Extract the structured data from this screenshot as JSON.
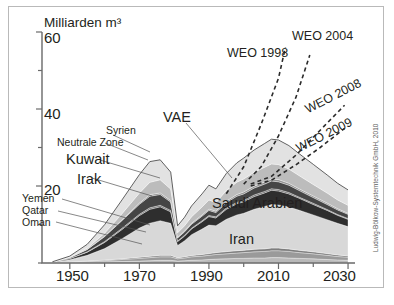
{
  "figure": {
    "yaxis_title": "Milliarden m³",
    "credit": "Ludwig-Bölkow-Systemtechnik GmbH, 2010"
  },
  "labels": {
    "y": [
      "60",
      "40",
      "20"
    ],
    "x": [
      "1950",
      "1970",
      "1990",
      "2010",
      "2030"
    ],
    "countries": {
      "syrien": "Syrien",
      "neutrale_zone": "Neutrale Zone",
      "kuwait": "Kuwait",
      "irak": "Irak",
      "yemen": "Yemen",
      "qatar": "Qatar",
      "oman": "Oman",
      "vae": "VAE",
      "saudi": "Saudi Arabien",
      "iran": "Iran"
    },
    "weo": {
      "w1998": "WEO 1998",
      "w2004": "WEO 2004",
      "w2008": "WEO 2008",
      "w2009": "WEO 2009"
    }
  },
  "chart_data": {
    "type": "area",
    "title": "",
    "subtitle": "",
    "xlabel": "",
    "ylabel": "Milliarden m³",
    "xlim": [
      1942,
      2032
    ],
    "ylim": [
      0,
      60
    ],
    "xticks": [
      1950,
      1960,
      1970,
      1980,
      1990,
      2000,
      2010,
      2020,
      2030
    ],
    "xticklabels": [
      "1950",
      "",
      "1970",
      "",
      "1990",
      "",
      "2010",
      "",
      "2030"
    ],
    "yticks": [
      0,
      10,
      20,
      30,
      40,
      50,
      60
    ],
    "yticklabels": [
      "",
      "",
      "20",
      "",
      "40",
      "",
      "60"
    ],
    "grid": false,
    "legend_position": "inline-annotations",
    "stacking": "stacked-area",
    "x": [
      1945,
      1950,
      1955,
      1960,
      1965,
      1970,
      1973,
      1976,
      1979,
      1981,
      1983,
      1985,
      1988,
      1990,
      1992,
      1995,
      1998,
      2000,
      2003,
      2006,
      2008,
      2010,
      2013,
      2016,
      2020,
      2024,
      2027,
      2030
    ],
    "series": [
      {
        "name": "Oman",
        "color": "#b9b9b9",
        "values": [
          0.0,
          0.1,
          0.2,
          0.3,
          0.4,
          0.5,
          0.6,
          0.7,
          0.7,
          0.5,
          0.6,
          0.7,
          0.8,
          0.9,
          1.0,
          1.1,
          1.2,
          1.2,
          1.3,
          1.3,
          1.4,
          1.4,
          1.3,
          1.2,
          1.1,
          0.9,
          0.8,
          0.7
        ]
      },
      {
        "name": "Qatar",
        "color": "#9a9a9a",
        "values": [
          0.0,
          0.1,
          0.2,
          0.3,
          0.5,
          0.7,
          0.8,
          0.9,
          0.9,
          0.6,
          0.7,
          0.9,
          1.0,
          1.1,
          1.2,
          1.3,
          1.4,
          1.5,
          1.6,
          1.7,
          1.8,
          1.8,
          1.7,
          1.5,
          1.3,
          1.1,
          0.9,
          0.8
        ]
      },
      {
        "name": "Yemen",
        "color": "#7d7d7d",
        "values": [
          0.0,
          0.05,
          0.1,
          0.15,
          0.2,
          0.3,
          0.35,
          0.4,
          0.4,
          0.25,
          0.3,
          0.35,
          0.4,
          0.45,
          0.5,
          0.55,
          0.6,
          0.6,
          0.65,
          0.7,
          0.7,
          0.7,
          0.65,
          0.6,
          0.5,
          0.45,
          0.4,
          0.35
        ]
      },
      {
        "name": "Iran",
        "color": "#d8d8d8",
        "values": [
          0.2,
          0.6,
          1.5,
          3.0,
          5.2,
          7.6,
          8.6,
          9.0,
          8.3,
          3.2,
          4.2,
          5.4,
          6.6,
          7.4,
          7.0,
          8.4,
          9.3,
          9.6,
          10.4,
          11.0,
          11.3,
          11.2,
          10.9,
          10.4,
          9.6,
          8.8,
          8.2,
          7.6
        ]
      },
      {
        "name": "Irak",
        "color": "#2e2e2e",
        "values": [
          0.1,
          0.3,
          0.8,
          1.6,
          2.4,
          3.2,
          3.6,
          3.6,
          3.0,
          1.0,
          1.2,
          1.5,
          1.9,
          2.2,
          2.0,
          2.6,
          2.9,
          3.0,
          3.3,
          3.5,
          3.7,
          3.6,
          3.4,
          3.1,
          2.7,
          2.4,
          2.1,
          1.9
        ]
      },
      {
        "name": "Neutrale Zone",
        "color": "#6b6b6b",
        "values": [
          0.0,
          0.05,
          0.1,
          0.2,
          0.3,
          0.35,
          0.4,
          0.4,
          0.35,
          0.15,
          0.2,
          0.2,
          0.25,
          0.3,
          0.3,
          0.3,
          0.35,
          0.35,
          0.4,
          0.4,
          0.4,
          0.4,
          0.35,
          0.3,
          0.3,
          0.25,
          0.2,
          0.2
        ]
      },
      {
        "name": "Kuwait",
        "color": "#454545",
        "values": [
          0.0,
          0.2,
          0.6,
          1.3,
          2.0,
          2.6,
          3.0,
          2.8,
          2.2,
          0.8,
          0.9,
          1.0,
          1.2,
          1.3,
          1.1,
          1.4,
          1.6,
          1.7,
          1.8,
          1.9,
          2.0,
          2.0,
          1.9,
          1.7,
          1.5,
          1.3,
          1.2,
          1.1
        ]
      },
      {
        "name": "Syrien",
        "color": "#8f8f8f",
        "values": [
          0.0,
          0.0,
          0.05,
          0.1,
          0.2,
          0.3,
          0.4,
          0.4,
          0.35,
          0.15,
          0.2,
          0.25,
          0.3,
          0.35,
          0.35,
          0.4,
          0.45,
          0.5,
          0.5,
          0.55,
          0.55,
          0.55,
          0.5,
          0.45,
          0.4,
          0.35,
          0.3,
          0.25
        ]
      },
      {
        "name": "VAE",
        "color": "#bcbcbc",
        "values": [
          0.0,
          0.1,
          0.3,
          0.8,
          1.6,
          2.6,
          3.2,
          3.4,
          3.0,
          1.2,
          1.4,
          1.7,
          2.1,
          2.4,
          2.2,
          2.8,
          3.2,
          3.4,
          3.6,
          3.8,
          3.9,
          3.9,
          3.7,
          3.4,
          3.0,
          2.6,
          2.3,
          2.1
        ]
      },
      {
        "name": "Saudi Arabien",
        "color": "#e2e2e2",
        "values": [
          0.0,
          0.3,
          1.0,
          2.2,
          3.6,
          4.8,
          5.4,
          5.2,
          4.4,
          1.8,
          2.2,
          2.8,
          3.4,
          3.8,
          3.6,
          4.4,
          5.0,
          5.4,
          5.8,
          6.2,
          6.4,
          6.4,
          6.1,
          5.7,
          5.2,
          4.7,
          4.3,
          4.0
        ]
      }
    ],
    "projections": [
      {
        "name": "WEO 1998",
        "style": "dashed",
        "points": [
          [
            1995,
            18.0
          ],
          [
            2000,
            25.0
          ],
          [
            2005,
            36.0
          ],
          [
            2010,
            48.0
          ],
          [
            2012,
            56.0
          ]
        ]
      },
      {
        "name": "WEO 2004",
        "style": "dashed",
        "points": [
          [
            2000,
            20.5
          ],
          [
            2005,
            25.0
          ],
          [
            2010,
            33.0
          ],
          [
            2015,
            43.0
          ],
          [
            2019,
            54.0
          ]
        ]
      },
      {
        "name": "WEO 2008",
        "style": "dashed",
        "points": [
          [
            2002,
            20.5
          ],
          [
            2008,
            22.5
          ],
          [
            2015,
            28.0
          ],
          [
            2022,
            34.5
          ],
          [
            2029,
            41.0
          ]
        ]
      },
      {
        "name": "WEO 2009",
        "style": "dashed",
        "points": [
          [
            2002,
            20.0
          ],
          [
            2008,
            21.5
          ],
          [
            2015,
            25.5
          ],
          [
            2022,
            30.0
          ],
          [
            2029,
            35.0
          ]
        ]
      }
    ]
  }
}
